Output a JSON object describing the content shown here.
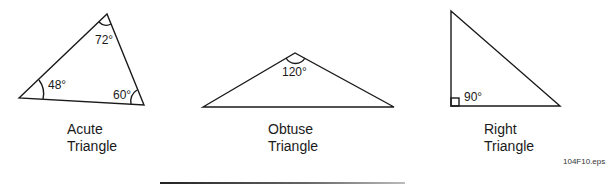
{
  "figure": {
    "file_label": "104F10.eps",
    "triangles": [
      {
        "id": "acute",
        "caption_line1": "Acute",
        "caption_line2": "Triangle",
        "angles": [
          {
            "vertex": "top",
            "label": "72°"
          },
          {
            "vertex": "left",
            "label": "48°"
          },
          {
            "vertex": "right",
            "label": "60°"
          }
        ]
      },
      {
        "id": "obtuse",
        "caption_line1": "Obtuse",
        "caption_line2": "Triangle",
        "angles": [
          {
            "vertex": "top",
            "label": "120°"
          }
        ]
      },
      {
        "id": "right",
        "caption_line1": "Right",
        "caption_line2": "Triangle",
        "angles": [
          {
            "vertex": "bottom-left",
            "label": "90°"
          }
        ]
      }
    ]
  }
}
